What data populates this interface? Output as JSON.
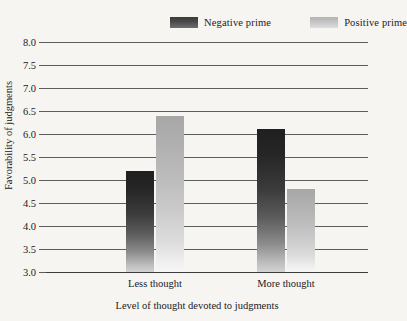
{
  "chart_data": {
    "type": "bar",
    "title": "",
    "subtitle": "",
    "xlabel": "Level of thought devoted to judgments",
    "ylabel": "Favorability of judgments",
    "categories": [
      "Less thought",
      "More thought"
    ],
    "series": [
      {
        "name": "Negative prime",
        "values": [
          5.2,
          6.1
        ],
        "color": "#3a3a3a"
      },
      {
        "name": "Positive prime",
        "values": [
          6.4,
          4.8
        ],
        "color": "#c4c4c4"
      }
    ],
    "ylim": [
      3.0,
      8.0
    ],
    "ytick_step": 0.5,
    "yticks": [
      "8.0",
      "7.5",
      "7.0",
      "6.5",
      "6.0",
      "5.5",
      "5.0",
      "4.5",
      "4.0",
      "3.5",
      "3.0"
    ],
    "grid": true,
    "grid_axis": "y",
    "legend": true,
    "legend_position": "top-right"
  },
  "legend": {
    "entries": [
      {
        "label": "Negative prime",
        "swatch": "negative-prime-swatch"
      },
      {
        "label": "Positive prime",
        "swatch": "positive-prime-swatch"
      }
    ]
  },
  "axes": {
    "y_title": "Favorability of judgments",
    "x_title": "Level of thought devoted to judgments"
  }
}
